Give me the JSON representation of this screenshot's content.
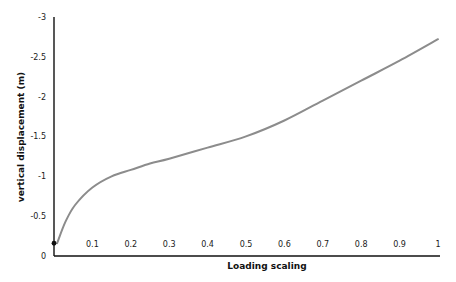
{
  "chart_data": {
    "type": "line",
    "title": "",
    "xlabel": "Loading scaling",
    "ylabel": "vertical displacement (m)",
    "xlim": [
      0,
      1
    ],
    "ylim": [
      0,
      -3
    ],
    "y_axis_inverted": true,
    "grid": false,
    "legend": null,
    "x_ticks": [
      "0.1",
      "0.2",
      "0.3",
      "0.4",
      "0.5",
      "0.6",
      "0.7",
      "0.8",
      "0.9",
      "1"
    ],
    "y_ticks": [
      "0",
      "-0.5",
      "-1",
      "-1.5",
      "-2",
      "-2.5",
      "-3"
    ],
    "series": [
      {
        "name": "vertical displacement",
        "color": "#8c8c8c",
        "x": [
          0.008,
          0.03,
          0.055,
          0.1,
          0.15,
          0.2,
          0.25,
          0.3,
          0.4,
          0.5,
          0.6,
          0.7,
          0.8,
          0.9,
          1.0
        ],
        "values": [
          -0.16,
          -0.43,
          -0.64,
          -0.86,
          -1.0,
          -1.08,
          -1.16,
          -1.22,
          -1.36,
          -1.5,
          -1.7,
          -1.95,
          -2.2,
          -2.45,
          -2.72
        ]
      }
    ],
    "marker": {
      "x": 0,
      "y": -0.16,
      "color": "#111111"
    }
  }
}
